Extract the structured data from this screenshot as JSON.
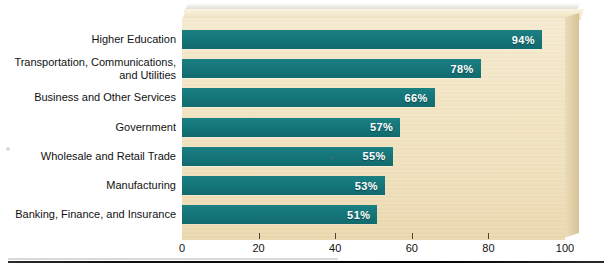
{
  "chart_data": {
    "type": "bar",
    "orientation": "horizontal",
    "title": "",
    "xlabel": "",
    "ylabel": "",
    "xlim": [
      0,
      100
    ],
    "xticks": [
      0,
      20,
      40,
      60,
      80,
      100
    ],
    "xticklabels": [
      "0",
      "20",
      "40",
      "60",
      "80",
      "100"
    ],
    "grid": false,
    "legend": false,
    "value_suffix": "%",
    "categories": [
      "Higher Education",
      "Transportation, Communications, and Utilities",
      "Business and Other Services",
      "Government",
      "Wholesale and Retail Trade",
      "Manufacturing",
      "Banking, Finance, and Insurance"
    ],
    "values": [
      94,
      78,
      66,
      57,
      55,
      53,
      51
    ],
    "value_labels": [
      "94%",
      "78%",
      "66%",
      "57%",
      "55%",
      "53%",
      "51%"
    ],
    "colors": {
      "bar": "#15767a",
      "panel": "#f2e4c3",
      "value_label": "#ffffff",
      "axis_text": "#111111",
      "rule": "#000000"
    }
  },
  "bars": [
    {
      "label_line1": "Higher Education",
      "label_line2": "",
      "value": 94,
      "value_label": "94%"
    },
    {
      "label_line1": "Transportation, Communications,",
      "label_line2": "and Utilities",
      "value": 78,
      "value_label": "78%"
    },
    {
      "label_line1": "Business and Other Services",
      "label_line2": "",
      "value": 66,
      "value_label": "66%"
    },
    {
      "label_line1": "Government",
      "label_line2": "",
      "value": 57,
      "value_label": "57%"
    },
    {
      "label_line1": "Wholesale and Retail Trade",
      "label_line2": "",
      "value": 55,
      "value_label": "55%"
    },
    {
      "label_line1": "Manufacturing",
      "label_line2": "",
      "value": 53,
      "value_label": "53%"
    },
    {
      "label_line1": "Banking, Finance, and Insurance",
      "label_line2": "",
      "value": 51,
      "value_label": "51%"
    }
  ],
  "axis": {
    "ticks": [
      {
        "label": "0",
        "value": 0
      },
      {
        "label": "20",
        "value": 20
      },
      {
        "label": "40",
        "value": 40
      },
      {
        "label": "60",
        "value": 60
      },
      {
        "label": "80",
        "value": 80
      },
      {
        "label": "100",
        "value": 100
      }
    ]
  }
}
